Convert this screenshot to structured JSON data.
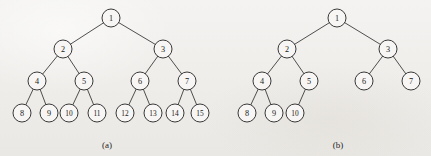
{
  "figure": {
    "background_color": "#f1efec",
    "node_fill": "#f7f6f4",
    "node_stroke": "#242424",
    "edge_color": "#242424",
    "node_radius": 9,
    "panels": [
      {
        "id": "panel-a",
        "caption": "(a)",
        "caption_x": 107,
        "caption_y": 145,
        "description": "complete binary tree with 15 nodes",
        "nodes": [
          {
            "label": "1",
            "x": 111,
            "y": 18
          },
          {
            "label": "2",
            "x": 63,
            "y": 49
          },
          {
            "label": "3",
            "x": 163,
            "y": 49
          },
          {
            "label": "4",
            "x": 37,
            "y": 81
          },
          {
            "label": "5",
            "x": 84,
            "y": 81
          },
          {
            "label": "6",
            "x": 140,
            "y": 81
          },
          {
            "label": "7",
            "x": 187,
            "y": 81
          },
          {
            "label": "8",
            "x": 22,
            "y": 113
          },
          {
            "label": "9",
            "x": 49,
            "y": 113
          },
          {
            "label": "10",
            "x": 69,
            "y": 113
          },
          {
            "label": "11",
            "x": 97,
            "y": 113
          },
          {
            "label": "12",
            "x": 125,
            "y": 113
          },
          {
            "label": "13",
            "x": 153,
            "y": 113
          },
          {
            "label": "14",
            "x": 175,
            "y": 113
          },
          {
            "label": "15",
            "x": 200,
            "y": 113
          }
        ],
        "edges": [
          [
            "1",
            "2"
          ],
          [
            "1",
            "3"
          ],
          [
            "2",
            "4"
          ],
          [
            "2",
            "5"
          ],
          [
            "3",
            "6"
          ],
          [
            "3",
            "7"
          ],
          [
            "4",
            "8"
          ],
          [
            "4",
            "9"
          ],
          [
            "5",
            "10"
          ],
          [
            "5",
            "11"
          ],
          [
            "6",
            "12"
          ],
          [
            "6",
            "13"
          ],
          [
            "7",
            "14"
          ],
          [
            "7",
            "15"
          ]
        ]
      },
      {
        "id": "panel-b",
        "caption": "(b)",
        "caption_x": 338,
        "caption_y": 145,
        "description": "complete binary tree with 10 nodes",
        "nodes": [
          {
            "label": "1",
            "x": 337,
            "y": 18
          },
          {
            "label": "2",
            "x": 287,
            "y": 49
          },
          {
            "label": "3",
            "x": 388,
            "y": 49
          },
          {
            "label": "4",
            "x": 262,
            "y": 81
          },
          {
            "label": "5",
            "x": 309,
            "y": 81
          },
          {
            "label": "6",
            "x": 364,
            "y": 81
          },
          {
            "label": "7",
            "x": 411,
            "y": 81
          },
          {
            "label": "8",
            "x": 247,
            "y": 113
          },
          {
            "label": "9",
            "x": 274,
            "y": 113
          },
          {
            "label": "10",
            "x": 295,
            "y": 113
          }
        ],
        "edges": [
          [
            "1",
            "2"
          ],
          [
            "1",
            "3"
          ],
          [
            "2",
            "4"
          ],
          [
            "2",
            "5"
          ],
          [
            "3",
            "6"
          ],
          [
            "3",
            "7"
          ],
          [
            "4",
            "8"
          ],
          [
            "4",
            "9"
          ],
          [
            "5",
            "10"
          ]
        ]
      }
    ]
  }
}
